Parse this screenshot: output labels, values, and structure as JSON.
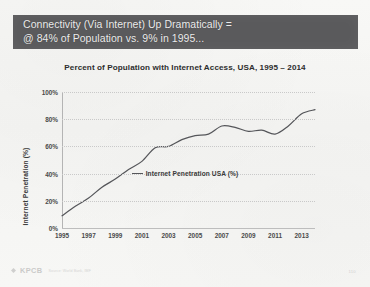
{
  "banner": {
    "text": "Connectivity (Via Internet) Up Dramatically =\n@ 84% of Population vs. 9% in 1995...",
    "background_color": "#5a5a5c",
    "text_color": "#ececec"
  },
  "footer": {
    "logo_text": "KPCB",
    "logo_mark": "diamond-icon",
    "source_text": "Source: World Bank, IMF",
    "page_number": "110"
  },
  "chart_data": {
    "type": "line",
    "title": "Percent of Population with Internet Access, USA, 1995 – 2014",
    "xlabel": "",
    "ylabel": "Internet Penetration (%)",
    "ylim": [
      0,
      100
    ],
    "ytick_labels": [
      "0%",
      "20%",
      "40%",
      "60%",
      "80%",
      "100%"
    ],
    "ytick_values": [
      0,
      20,
      40,
      60,
      80,
      100
    ],
    "xlim": [
      1995,
      2014
    ],
    "xtick_labels": [
      "1995",
      "1997",
      "1999",
      "2001",
      "2003",
      "2005",
      "2007",
      "2009",
      "2011",
      "2013"
    ],
    "xtick_values": [
      1995,
      1997,
      1999,
      2001,
      2003,
      2005,
      2007,
      2009,
      2011,
      2013
    ],
    "grid": true,
    "legend_position": "bottom",
    "x": [
      1995,
      1996,
      1997,
      1998,
      1999,
      2000,
      2001,
      2002,
      2003,
      2004,
      2005,
      2006,
      2007,
      2008,
      2009,
      2010,
      2011,
      2012,
      2013,
      2014
    ],
    "series": [
      {
        "name": "Internet Penetration USA (%)",
        "color": "#55565a",
        "values": [
          9,
          16,
          22,
          30,
          36,
          43,
          49,
          59,
          60,
          65,
          68,
          69,
          75,
          74,
          71,
          72,
          69,
          75,
          84,
          87
        ]
      }
    ]
  }
}
